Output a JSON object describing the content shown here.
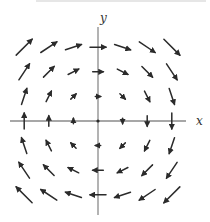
{
  "chart_data": {
    "type": "vector_field",
    "title": "",
    "xlabel": "x",
    "ylabel": "y",
    "grid": false,
    "legend": null,
    "field_description": "Rotational (clockwise) vector field, approx F(x,y) = (y, -x)",
    "x_grid": [
      -3,
      -2,
      -1,
      0,
      1,
      2,
      3
    ],
    "y_grid": [
      -3,
      -2,
      -1,
      0,
      1,
      2,
      3
    ],
    "vectors": [
      {
        "x": -3,
        "y": 3,
        "u": 3,
        "v": 3
      },
      {
        "x": -2,
        "y": 3,
        "u": 3,
        "v": 2
      },
      {
        "x": -1,
        "y": 3,
        "u": 3,
        "v": 1
      },
      {
        "x": 0,
        "y": 3,
        "u": 3,
        "v": 0
      },
      {
        "x": 1,
        "y": 3,
        "u": 3,
        "v": -1
      },
      {
        "x": 2,
        "y": 3,
        "u": 3,
        "v": -2
      },
      {
        "x": 3,
        "y": 3,
        "u": 3,
        "v": -3
      },
      {
        "x": -3,
        "y": 2,
        "u": 2,
        "v": 3
      },
      {
        "x": -2,
        "y": 2,
        "u": 2,
        "v": 2
      },
      {
        "x": -1,
        "y": 2,
        "u": 2,
        "v": 1
      },
      {
        "x": 0,
        "y": 2,
        "u": 2,
        "v": 0
      },
      {
        "x": 1,
        "y": 2,
        "u": 2,
        "v": -1
      },
      {
        "x": 2,
        "y": 2,
        "u": 2,
        "v": -2
      },
      {
        "x": 3,
        "y": 2,
        "u": 2,
        "v": -3
      },
      {
        "x": -3,
        "y": 1,
        "u": 1,
        "v": 3
      },
      {
        "x": -2,
        "y": 1,
        "u": 1,
        "v": 2
      },
      {
        "x": -1,
        "y": 1,
        "u": 1,
        "v": 1
      },
      {
        "x": 0,
        "y": 1,
        "u": 1,
        "v": 0
      },
      {
        "x": 1,
        "y": 1,
        "u": 1,
        "v": -1
      },
      {
        "x": 2,
        "y": 1,
        "u": 1,
        "v": -2
      },
      {
        "x": 3,
        "y": 1,
        "u": 1,
        "v": -3
      },
      {
        "x": -3,
        "y": 0,
        "u": 0,
        "v": 3
      },
      {
        "x": -2,
        "y": 0,
        "u": 0,
        "v": 2
      },
      {
        "x": -1,
        "y": 0,
        "u": 0,
        "v": 1
      },
      {
        "x": 0,
        "y": 0,
        "u": 0,
        "v": 0
      },
      {
        "x": 1,
        "y": 0,
        "u": 0,
        "v": -1
      },
      {
        "x": 2,
        "y": 0,
        "u": 0,
        "v": -2
      },
      {
        "x": 3,
        "y": 0,
        "u": 0,
        "v": -3
      },
      {
        "x": -3,
        "y": -1,
        "u": -1,
        "v": 3
      },
      {
        "x": -2,
        "y": -1,
        "u": -1,
        "v": 2
      },
      {
        "x": -1,
        "y": -1,
        "u": -1,
        "v": 1
      },
      {
        "x": 0,
        "y": -1,
        "u": -1,
        "v": 0
      },
      {
        "x": 1,
        "y": -1,
        "u": -1,
        "v": -1
      },
      {
        "x": 2,
        "y": -1,
        "u": -1,
        "v": -2
      },
      {
        "x": 3,
        "y": -1,
        "u": -1,
        "v": -3
      },
      {
        "x": -3,
        "y": -2,
        "u": -2,
        "v": 3
      },
      {
        "x": -2,
        "y": -2,
        "u": -2,
        "v": 2
      },
      {
        "x": -1,
        "y": -2,
        "u": -2,
        "v": 1
      },
      {
        "x": 0,
        "y": -2,
        "u": -2,
        "v": 0
      },
      {
        "x": 1,
        "y": -2,
        "u": -2,
        "v": -1
      },
      {
        "x": 2,
        "y": -2,
        "u": -2,
        "v": -2
      },
      {
        "x": 3,
        "y": -2,
        "u": -2,
        "v": -3
      },
      {
        "x": -3,
        "y": -3,
        "u": -3,
        "v": 3
      },
      {
        "x": -2,
        "y": -3,
        "u": -3,
        "v": 2
      },
      {
        "x": -1,
        "y": -3,
        "u": -3,
        "v": 1
      },
      {
        "x": 0,
        "y": -3,
        "u": -3,
        "v": 0
      },
      {
        "x": 1,
        "y": -3,
        "u": -3,
        "v": -1
      },
      {
        "x": 2,
        "y": -3,
        "u": -3,
        "v": -2
      },
      {
        "x": 3,
        "y": -3,
        "u": -3,
        "v": -3
      }
    ],
    "xlim": [
      -3.6,
      3.6
    ],
    "ylim": [
      -3.9,
      3.9
    ]
  },
  "layout": {
    "origin_px": [
      98,
      121
    ],
    "spacing_px": 24.6,
    "arrow_scale_px": 5.3,
    "x_axis_px": [
      10,
      186
    ],
    "y_axis_px": [
      27,
      215
    ],
    "x_label_px": [
      196,
      125
    ],
    "y_label_px": [
      100,
      22
    ],
    "axis_color": "#8a8a8a",
    "arrow_color": "#2b2b2b"
  }
}
